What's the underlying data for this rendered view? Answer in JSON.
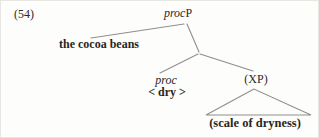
{
  "figure": {
    "example_number": "(54)",
    "tree": {
      "root": {
        "label_italic": "proc",
        "label_roman": "P"
      },
      "specifier": {
        "label": "the cocoa beans"
      },
      "head": {
        "label_italic": "proc",
        "complement_word": "< dry >"
      },
      "complement": {
        "label": "(XP)",
        "content": "(scale of dryness)"
      }
    }
  },
  "colors": {
    "background": "#fdfdfb",
    "text": "#2e2a27",
    "branch": "#8f8f8f"
  }
}
